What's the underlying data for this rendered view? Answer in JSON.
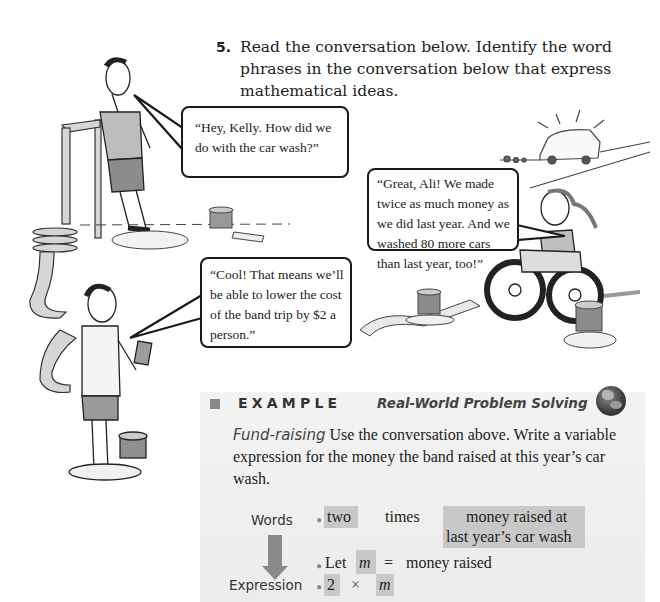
{
  "question": {
    "number": "5.",
    "text": "Read the conversation below. Identify the word phrases in the conversation below that express mathematical ideas."
  },
  "conversation": [
    {
      "speaker": "Ali",
      "text": "“Hey, Kelly. How did we do with the car wash?”"
    },
    {
      "speaker": "Kelly",
      "text": "“Great, Ali! We made twice as much money as we did last year. And we washed 80 more cars than last year, too!”"
    },
    {
      "speaker": "Friend",
      "text": "“Cool! That means we’ll be able to lower the cost of the band trip by $2 a person.”"
    }
  ],
  "example": {
    "title": "EXAMPLE",
    "subtitle": "Real-World Problem Solving",
    "lead": "Fund-raising",
    "body": " Use the conversation above. Write a variable expression for the money the band raised at this year’s car wash.",
    "words_label": "Words",
    "expression_label": "Expression",
    "row1": {
      "a": "two",
      "op": "times",
      "b_line1": "money raised at",
      "b_line2": "last year’s car wash"
    },
    "row2": {
      "let": "Let",
      "var": "m",
      "eq": "=",
      "def": "money raised"
    },
    "row3": {
      "a": "2",
      "op": "×",
      "var": "m"
    },
    "bullet": "•",
    "colors": {
      "box_bg": "#f0f0f0",
      "highlight": "#c8c8c8",
      "accent": "#888888"
    }
  }
}
